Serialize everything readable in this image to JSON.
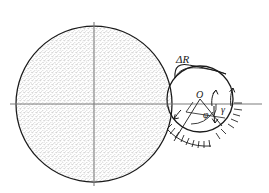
{
  "figure": {
    "background_color": "#ffffff",
    "line_color": "#1a1a1a",
    "stipple_color": "#8c8c8c",
    "axis_color": "#7a7a7a",
    "labels": {
      "delta_r": "ΔR",
      "center_o": "O",
      "angle_phi": "φ",
      "angle_gamma": "γ"
    },
    "icons": {
      "large_disk": "stippled-circle",
      "small_disk": "small-circle",
      "axes": "crosshair-axes",
      "hatching": "ground-hatching",
      "leader": "curved-leader-line",
      "arrows": "direction-arrows"
    },
    "geometry": {
      "large_circle": {
        "cx": 94,
        "cy": 104,
        "r": 78
      },
      "small_circle": {
        "cx": 200,
        "cy": 99,
        "r": 33
      },
      "horizontal_axis": {
        "x1": 10,
        "y1": 104,
        "x2": 262,
        "y2": 104
      },
      "vertical_axis": {
        "x1": 94,
        "y1": 22,
        "x2": 94,
        "y2": 186
      }
    }
  }
}
